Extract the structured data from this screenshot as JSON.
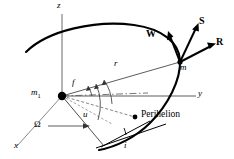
{
  "figure": {
    "kind": "orbital-elements-diagram",
    "stroke_color": "#000000",
    "dash_color": "#555555",
    "background": "#ffffff"
  },
  "axes": {
    "z": "z",
    "y": "y",
    "x": "x"
  },
  "bodies": {
    "central_mass": "m",
    "central_mass_sub": "1",
    "orbiting_mass": "m"
  },
  "angles": {
    "true_anomaly": "f",
    "argument_of_latitude": "u",
    "ascending_node": "Ω",
    "inclination": "i"
  },
  "distances": {
    "radius": "r"
  },
  "points": {
    "perihelion": "Perihelion"
  },
  "vectors": {
    "radial": "R",
    "transverse": "S",
    "normal": "W"
  }
}
